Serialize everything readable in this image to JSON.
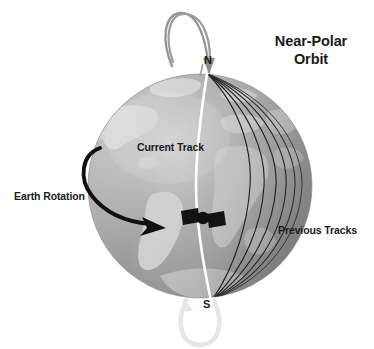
{
  "figure": {
    "title_line_1": "Near-Polar",
    "title_line_2": "Orbit",
    "labels": {
      "earth_rotation": "Earth Rotation",
      "current_track": "Current Track",
      "previous_tracks": "Previous Tracks",
      "pole_north": "N",
      "pole_south": "S"
    },
    "colors": {
      "background": "#ffffff",
      "text": "#1a1a1a",
      "ocean_light": "#b9b9b9",
      "ocean_mid": "#9c9c9c",
      "ocean_dark": "#7f7f7f",
      "land_light": "#d2d2d2",
      "land_mid": "#c2c2c2",
      "current_track": "#ffffff",
      "previous_track": "#1c1c1c",
      "rotation_arrow": "#111111",
      "orbit_arc_north": "#8f8f8f",
      "orbit_arc_south": "#e8e8e8",
      "satellite": "#111111"
    },
    "geometry": {
      "globe_center_x": 200,
      "globe_center_y": 186,
      "globe_radius": 112,
      "axis_top_y": 74,
      "axis_bottom_y": 300
    },
    "elements": {
      "globe": "earth-globe",
      "axis": "rotation-axis",
      "current_track_line": "current-orbit-track",
      "previous_track_count": 6,
      "satellite": "satellite-icon",
      "rotation_arrow": "earth-rotation-arrow",
      "orbit_arc_north": "orbit-arc-north",
      "orbit_arc_south": "orbit-arc-south"
    }
  }
}
